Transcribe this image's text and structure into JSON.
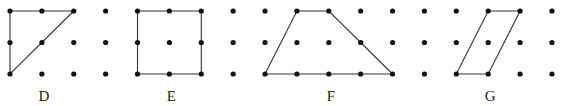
{
  "grid": {
    "cols": 18,
    "rows": 3,
    "x0": 10,
    "y0": 11,
    "dx": 31.88,
    "dy": 31.5,
    "dot_radius": 2.6,
    "dot_color": "#111111",
    "line_color": "#333333"
  },
  "shapes": [
    {
      "label": "D",
      "kind": "right-triangle",
      "points": [
        [
          0,
          0
        ],
        [
          2,
          0
        ],
        [
          0,
          2
        ]
      ],
      "label_col": 1
    },
    {
      "label": "E",
      "kind": "square",
      "points": [
        [
          4,
          0
        ],
        [
          6,
          0
        ],
        [
          6,
          2
        ],
        [
          4,
          2
        ]
      ],
      "label_col": 5
    },
    {
      "label": "F",
      "kind": "trapezoid",
      "points": [
        [
          9,
          0
        ],
        [
          10,
          0
        ],
        [
          12,
          2
        ],
        [
          8,
          2
        ]
      ],
      "label_col": 10
    },
    {
      "label": "G",
      "kind": "parallelogram",
      "points": [
        [
          15,
          0
        ],
        [
          16,
          0
        ],
        [
          15,
          2
        ],
        [
          14,
          2
        ]
      ],
      "label_col": 15
    }
  ],
  "labels": {
    "d": "D",
    "e": "E",
    "f": "F",
    "g": "G"
  }
}
